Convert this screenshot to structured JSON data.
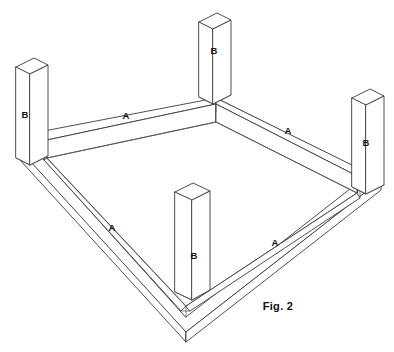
{
  "figure": {
    "caption": "Fig. 2",
    "background_color": "#ffffff",
    "line_color": "#3b3b3b",
    "text_color": "#111111"
  },
  "labels": {
    "rail": "A",
    "leg": "B"
  },
  "parts": [
    {
      "id": "rail-top-left",
      "label": "A",
      "x": 126,
      "y": 116
    },
    {
      "id": "rail-top-right",
      "label": "A",
      "x": 288,
      "y": 131
    },
    {
      "id": "rail-bottom-left",
      "label": "A",
      "x": 112,
      "y": 228
    },
    {
      "id": "rail-bottom-right",
      "label": "A",
      "x": 275,
      "y": 243
    },
    {
      "id": "leg-left",
      "label": "B",
      "x": 25,
      "y": 115
    },
    {
      "id": "leg-back",
      "label": "B",
      "x": 214,
      "y": 51
    },
    {
      "id": "leg-right",
      "label": "B",
      "x": 366,
      "y": 143
    },
    {
      "id": "leg-front",
      "label": "B",
      "x": 194,
      "y": 256
    }
  ],
  "caption_position": {
    "x": 278,
    "y": 307
  }
}
